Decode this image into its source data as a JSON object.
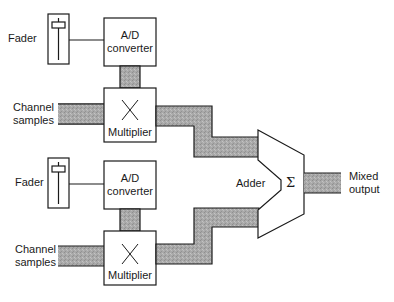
{
  "diagram": {
    "type": "block-diagram",
    "colors": {
      "line": "#1a1a1a",
      "bus_fill": "#a8a8a8",
      "background": "#ffffff"
    },
    "channels": [
      {
        "fader_label": "Fader",
        "converter_label_line1": "A/D",
        "converter_label_line2": "converter",
        "input_label_line1": "Channel",
        "input_label_line2": "samples",
        "multiplier_symbol": "×",
        "multiplier_label": "Multiplier"
      },
      {
        "fader_label": "Fader",
        "converter_label_line1": "A/D",
        "converter_label_line2": "converter",
        "input_label_line1": "Channel",
        "input_label_line2": "samples",
        "multiplier_symbol": "×",
        "multiplier_label": "Multiplier"
      }
    ],
    "adder": {
      "label": "Adder",
      "symbol": "Σ"
    },
    "output": {
      "label_line1": "Mixed",
      "label_line2": "output"
    }
  }
}
